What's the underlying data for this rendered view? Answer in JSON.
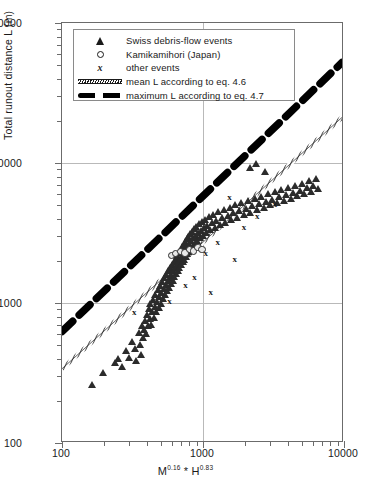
{
  "chart_data": {
    "type": "scatter",
    "title": "",
    "xlabel": "M0.16 * H0.83",
    "xlabel_parts": {
      "m_base": "M",
      "m_exp": "0.16",
      "operator": " * ",
      "h_base": "H",
      "h_exp": "0.83"
    },
    "ylabel": "Total runout distance L (m)",
    "xscale": "log",
    "yscale": "log",
    "xlim": [
      100,
      10000
    ],
    "ylim": [
      100,
      100000
    ],
    "xticks": [
      100,
      1000,
      10000
    ],
    "xtick_labels": [
      "100",
      "1000",
      "10000"
    ],
    "yticks": [
      100,
      1000,
      10000,
      100000
    ],
    "ytick_labels": [
      "100",
      "1000",
      "10000",
      "100000"
    ],
    "grid": "major gridlines at x=1000, y=1000 and y=10000",
    "legend_position": "upper-left inside axes",
    "legend": [
      {
        "marker": "triangle",
        "label": "Swiss debris-flow events"
      },
      {
        "marker": "circle",
        "label": "Kamikamihori (Japan)"
      },
      {
        "marker": "x",
        "label": "other events"
      },
      {
        "marker": "hatched-line",
        "label": "mean L  according to eq. 4.6"
      },
      {
        "marker": "thick-dashed-line",
        "label": "maximum L according to eq. 4.7"
      }
    ],
    "series": [
      {
        "name": "Swiss debris-flow events",
        "marker": "triangle",
        "color": "#2b2b2b",
        "points": [
          [
            163,
            262
          ],
          [
            196,
            318
          ],
          [
            238,
            372
          ],
          [
            250,
            398
          ],
          [
            268,
            352
          ],
          [
            286,
            455
          ],
          [
            302,
            408
          ],
          [
            315,
            530
          ],
          [
            330,
            470
          ],
          [
            338,
            388
          ],
          [
            352,
            612
          ],
          [
            360,
            505
          ],
          [
            366,
            430
          ],
          [
            372,
            690
          ],
          [
            378,
            560
          ],
          [
            384,
            640
          ],
          [
            390,
            745
          ],
          [
            396,
            600
          ],
          [
            402,
            820
          ],
          [
            408,
            685
          ],
          [
            414,
            905
          ],
          [
            420,
            770
          ],
          [
            426,
            980
          ],
          [
            432,
            700
          ],
          [
            438,
            865
          ],
          [
            444,
            1060
          ],
          [
            450,
            790
          ],
          [
            456,
            935
          ],
          [
            462,
            1150
          ],
          [
            468,
            860
          ],
          [
            474,
            1020
          ],
          [
            480,
            1240
          ],
          [
            486,
            925
          ],
          [
            492,
            1105
          ],
          [
            498,
            1330
          ],
          [
            504,
            995
          ],
          [
            510,
            1185
          ],
          [
            516,
            1420
          ],
          [
            522,
            1070
          ],
          [
            528,
            1270
          ],
          [
            534,
            1510
          ],
          [
            540,
            1140
          ],
          [
            546,
            1350
          ],
          [
            552,
            1600
          ],
          [
            558,
            1215
          ],
          [
            564,
            1430
          ],
          [
            570,
            1695
          ],
          [
            576,
            1290
          ],
          [
            582,
            1515
          ],
          [
            588,
            1790
          ],
          [
            594,
            1370
          ],
          [
            600,
            1600
          ],
          [
            606,
            1885
          ],
          [
            612,
            1450
          ],
          [
            618,
            1685
          ],
          [
            624,
            1980
          ],
          [
            630,
            1530
          ],
          [
            636,
            1775
          ],
          [
            642,
            2080
          ],
          [
            648,
            1610
          ],
          [
            654,
            1865
          ],
          [
            660,
            2180
          ],
          [
            666,
            1695
          ],
          [
            672,
            1955
          ],
          [
            678,
            2285
          ],
          [
            684,
            1780
          ],
          [
            690,
            2050
          ],
          [
            696,
            2395
          ],
          [
            702,
            1865
          ],
          [
            708,
            2145
          ],
          [
            714,
            2505
          ],
          [
            720,
            1955
          ],
          [
            726,
            2245
          ],
          [
            732,
            2620
          ],
          [
            738,
            2045
          ],
          [
            744,
            2345
          ],
          [
            750,
            2735
          ],
          [
            756,
            2140
          ],
          [
            762,
            2450
          ],
          [
            768,
            2855
          ],
          [
            774,
            2235
          ],
          [
            780,
            2555
          ],
          [
            786,
            2975
          ],
          [
            792,
            2335
          ],
          [
            800,
            2665
          ],
          [
            810,
            3100
          ],
          [
            820,
            2440
          ],
          [
            830,
            2780
          ],
          [
            840,
            3230
          ],
          [
            850,
            2550
          ],
          [
            860,
            2900
          ],
          [
            870,
            3365
          ],
          [
            880,
            2665
          ],
          [
            890,
            3025
          ],
          [
            900,
            3505
          ],
          [
            910,
            2785
          ],
          [
            925,
            3155
          ],
          [
            940,
            3650
          ],
          [
            955,
            2910
          ],
          [
            970,
            3290
          ],
          [
            985,
            3800
          ],
          [
            1000,
            3040
          ],
          [
            1020,
            3430
          ],
          [
            1040,
            3955
          ],
          [
            1060,
            3175
          ],
          [
            1080,
            3575
          ],
          [
            1100,
            4115
          ],
          [
            1130,
            3315
          ],
          [
            1160,
            3725
          ],
          [
            1190,
            4280
          ],
          [
            1220,
            3460
          ],
          [
            1250,
            3880
          ],
          [
            1290,
            4450
          ],
          [
            1330,
            3610
          ],
          [
            1370,
            4040
          ],
          [
            1410,
            4625
          ],
          [
            1450,
            3765
          ],
          [
            1500,
            4205
          ],
          [
            1550,
            4805
          ],
          [
            1600,
            3925
          ],
          [
            1650,
            4375
          ],
          [
            1700,
            4990
          ],
          [
            1760,
            4090
          ],
          [
            1820,
            4550
          ],
          [
            1880,
            5180
          ],
          [
            1950,
            4260
          ],
          [
            2020,
            4730
          ],
          [
            2090,
            5375
          ],
          [
            2170,
            4435
          ],
          [
            2250,
            4915
          ],
          [
            2330,
            5575
          ],
          [
            2420,
            4615
          ],
          [
            2510,
            5105
          ],
          [
            2600,
            5780
          ],
          [
            2700,
            4800
          ],
          [
            2800,
            5300
          ],
          [
            2900,
            5990
          ],
          [
            3010,
            4990
          ],
          [
            3120,
            5500
          ],
          [
            3240,
            6205
          ],
          [
            3360,
            5185
          ],
          [
            3490,
            5710
          ],
          [
            3620,
            6430
          ],
          [
            3760,
            5385
          ],
          [
            3900,
            5925
          ],
          [
            4050,
            6660
          ],
          [
            4200,
            5590
          ],
          [
            4360,
            6145
          ],
          [
            4530,
            6900
          ],
          [
            4700,
            5805
          ],
          [
            4880,
            6375
          ],
          [
            5060,
            7150
          ],
          [
            5250,
            6025
          ],
          [
            5450,
            6610
          ],
          [
            5660,
            7410
          ],
          [
            5870,
            6255
          ],
          [
            6090,
            6855
          ],
          [
            6320,
            7680
          ],
          [
            6560,
            6490
          ],
          [
            2150,
            9200
          ],
          [
            2380,
            9900
          ],
          [
            2750,
            8600
          ]
        ]
      },
      {
        "name": "Kamikamihori (Japan)",
        "marker": "circle",
        "color": "#2b2b2b",
        "points": [
          [
            598,
            2180
          ],
          [
            640,
            2255
          ],
          [
            690,
            2330
          ],
          [
            745,
            2270
          ],
          [
            800,
            2420
          ],
          [
            860,
            2345
          ],
          [
            920,
            2480
          ],
          [
            985,
            2405
          ]
        ]
      },
      {
        "name": "other events",
        "marker": "x",
        "color": "#1a1a1a",
        "points": [
          [
            330,
            860
          ],
          [
            585,
            1020
          ],
          [
            760,
            1330
          ],
          [
            880,
            1520
          ],
          [
            1060,
            2240
          ],
          [
            1290,
            2690
          ],
          [
            1560,
            5700
          ],
          [
            1980,
            3480
          ],
          [
            2460,
            4150
          ],
          [
            3280,
            5020
          ],
          [
            1150,
            1180
          ],
          [
            1700,
            2050
          ]
        ]
      }
    ],
    "fit_lines": [
      {
        "name": "mean L according to eq. 4.6",
        "style": "thin hatched double line",
        "x_start": 100,
        "y_start": 330,
        "x_end": 10000,
        "y_end": 21000
      },
      {
        "name": "maximum L according to eq. 4.7",
        "style": "thick black dashed line",
        "x_start": 100,
        "y_start": 610,
        "x_end": 10000,
        "y_end": 52000
      }
    ]
  }
}
